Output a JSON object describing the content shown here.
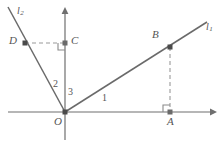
{
  "figure": {
    "colors": {
      "axis": "#6f6f6f",
      "line": "#6a6a6a",
      "dashed": "#9a9a9a",
      "point": "#4a4a4a",
      "text": "#555555",
      "background": "#ffffff"
    },
    "axes": {
      "x_axis": {
        "name": "x-axis",
        "y": 112,
        "x_start": 8,
        "x_end": 214,
        "arrow": "right"
      },
      "y_axis": {
        "name": "y-axis",
        "x": 65,
        "y_start": 138,
        "y_end": 10,
        "arrow": "up"
      },
      "origin": {
        "x": 65,
        "y": 112
      }
    },
    "lines": [
      {
        "id": "l1",
        "label": "l",
        "subscript": "1",
        "from": {
          "x": 65,
          "y": 112
        },
        "to": {
          "x": 207,
          "y": 22
        }
      },
      {
        "id": "l2",
        "label": "l",
        "subscript": "2",
        "from": {
          "x": 65,
          "y": 112
        },
        "to": {
          "x": 8,
          "y": 7
        }
      }
    ],
    "points": [
      {
        "id": "A",
        "label": "A",
        "x": 170,
        "y": 112,
        "label_dx": -3,
        "label_dy": 6,
        "on": "x-axis"
      },
      {
        "id": "B",
        "label": "B",
        "x": 170,
        "y": 47,
        "label_dx": -16,
        "label_dy": -17,
        "on": "l1"
      },
      {
        "id": "C",
        "label": "C",
        "x": 65,
        "y": 43,
        "label_dx": 5,
        "label_dy": -7,
        "on": "y-axis"
      },
      {
        "id": "D",
        "label": "D",
        "x": 25,
        "y": 43,
        "label_dx": -15,
        "label_dy": -7,
        "on": "l2"
      }
    ],
    "dashed_segments": [
      {
        "id": "BA",
        "name": "dashed-segment-b-to-a",
        "x1": 170,
        "y1": 47,
        "x2": 170,
        "y2": 112
      },
      {
        "id": "DC",
        "name": "dashed-segment-d-to-c",
        "x1": 25,
        "y1": 43,
        "x2": 65,
        "y2": 43
      }
    ],
    "right_angle_marks": [
      {
        "id": "at-A",
        "name": "right-angle-mark-a",
        "x": 163,
        "y": 105,
        "size": 7
      },
      {
        "id": "at-C",
        "name": "right-angle-mark-c",
        "x": 58,
        "y": 43,
        "size": 7
      }
    ],
    "angle_labels": [
      {
        "id": "angle-1",
        "text": "1",
        "x": 103,
        "y": 96
      },
      {
        "id": "angle-2",
        "text": "2",
        "x": 55,
        "y": 84
      },
      {
        "id": "angle-3",
        "text": "3",
        "x": 70,
        "y": 91
      }
    ],
    "origin_label": {
      "text": "O",
      "x": 55,
      "y": 117
    },
    "line_labels": [
      {
        "id": "l1-label",
        "base": "l",
        "sub": "1",
        "x": 207,
        "y": 28
      },
      {
        "id": "l2-label",
        "base": "l",
        "sub": "2",
        "x": 18,
        "y": 9
      }
    ]
  }
}
